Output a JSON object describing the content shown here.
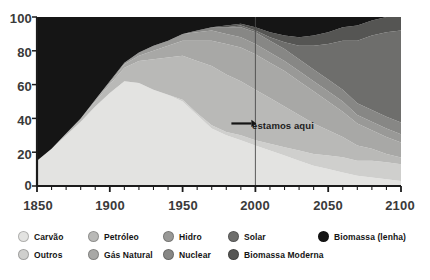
{
  "chart_data": {
    "type": "area",
    "title": "",
    "subtitle": "",
    "xlabel": "",
    "ylabel": "",
    "stacked": true,
    "normalized_percent": true,
    "grid": false,
    "legend_position": "bottom",
    "xlim": [
      1850,
      2100
    ],
    "ylim": [
      0,
      100
    ],
    "xticks": [
      1850,
      1900,
      1950,
      2000,
      2050,
      2100
    ],
    "xtick_labels": [
      "1850",
      "1900",
      "1950",
      "2000",
      "2050",
      "2100"
    ],
    "minor_xtick_step": 10,
    "yticks": [
      0,
      20,
      40,
      60,
      80,
      100
    ],
    "ytick_labels": [
      "0",
      "20",
      "40",
      "60",
      "80",
      "100"
    ],
    "x": [
      1850,
      1860,
      1870,
      1880,
      1890,
      1900,
      1910,
      1920,
      1930,
      1940,
      1950,
      1960,
      1970,
      1980,
      1990,
      2000,
      2010,
      2020,
      2030,
      2040,
      2050,
      2060,
      2070,
      2080,
      2090,
      2100
    ],
    "series": [
      {
        "name": "Carvão",
        "color": "#e3e3e1",
        "values": [
          15,
          22,
          30,
          38,
          47,
          55,
          62,
          61,
          57,
          54,
          50,
          42,
          34,
          30,
          27,
          24,
          21,
          18,
          15,
          12,
          10,
          8,
          6,
          5,
          4,
          3
        ]
      },
      {
        "name": "Petróleo",
        "color": "#b9b9b7",
        "values": [
          0,
          0,
          1,
          2,
          3,
          5,
          8,
          13,
          18,
          22,
          26,
          31,
          35,
          34,
          32,
          30,
          27,
          24,
          21,
          18,
          15,
          12,
          9,
          7,
          5,
          4
        ]
      },
      {
        "name": "Hidro",
        "color": "#999997",
        "values": [
          0,
          0,
          0,
          0,
          0,
          1,
          1,
          2,
          3,
          3,
          4,
          5,
          6,
          6,
          6,
          6,
          6,
          6,
          6,
          6,
          6,
          6,
          5,
          5,
          5,
          5
        ]
      },
      {
        "name": "Solar",
        "color": "#6e6e6c",
        "values": [
          0,
          0,
          0,
          0,
          0,
          0,
          0,
          0,
          0,
          0,
          0,
          0,
          0,
          0,
          1,
          1,
          2,
          4,
          8,
          14,
          21,
          29,
          37,
          44,
          50,
          55
        ]
      },
      {
        "name": "Outros",
        "color": "#cfcfcd",
        "values": [
          0,
          0,
          0,
          0,
          0,
          0,
          0,
          0,
          0,
          0,
          1,
          1,
          2,
          2,
          3,
          3,
          4,
          5,
          6,
          7,
          8,
          9,
          9,
          10,
          10,
          10
        ]
      },
      {
        "name": "Gás Natural",
        "color": "#a8a8a6",
        "values": [
          0,
          0,
          0,
          0,
          1,
          1,
          2,
          3,
          5,
          7,
          9,
          12,
          15,
          18,
          20,
          21,
          21,
          21,
          20,
          19,
          17,
          15,
          13,
          11,
          10,
          9
        ]
      },
      {
        "name": "Nuclear",
        "color": "#878785",
        "values": [
          0,
          0,
          0,
          0,
          0,
          0,
          0,
          0,
          0,
          0,
          0,
          1,
          2,
          4,
          6,
          7,
          7,
          7,
          7,
          7,
          7,
          7,
          7,
          7,
          7,
          7
        ]
      },
      {
        "name": "Biomassa Moderna",
        "color": "#555553",
        "values": [
          0,
          0,
          0,
          0,
          0,
          0,
          0,
          0,
          0,
          0,
          0,
          0,
          0,
          1,
          1,
          2,
          3,
          4,
          5,
          6,
          7,
          8,
          9,
          9,
          9,
          8
        ]
      },
      {
        "name": "Biomassa (lenha)",
        "color": "#151515",
        "values": [
          85,
          78,
          69,
          60,
          49,
          38,
          27,
          21,
          17,
          14,
          10,
          8,
          6,
          5,
          4,
          6,
          9,
          11,
          12,
          11,
          9,
          6,
          5,
          2,
          0,
          0
        ]
      }
    ],
    "stack_order": [
      "Carvão",
      "Outros",
      "Petróleo",
      "Gás Natural",
      "Hidro",
      "Nuclear",
      "Solar",
      "Biomassa Moderna",
      "Biomassa (lenha)"
    ],
    "annotations": [
      {
        "text": "estamos aqui",
        "x": 2000,
        "y": 37,
        "marker": "arrow-right",
        "vertical_line_at_x": 2000
      }
    ]
  },
  "axes": {
    "y_tick_labels": [
      "100",
      "80",
      "60",
      "40",
      "20",
      "0"
    ],
    "x_tick_labels": [
      "1850",
      "1900",
      "1950",
      "2000",
      "2050",
      "2100"
    ]
  },
  "annotation": {
    "label": "estamos aqui"
  },
  "legend": {
    "columns": [
      {
        "entries": [
          {
            "label": "Carvão",
            "color": "#e3e3e1"
          },
          {
            "label": "Outros",
            "color": "#cfcfcd"
          }
        ]
      },
      {
        "entries": [
          {
            "label": "Petróleo",
            "color": "#b9b9b7"
          },
          {
            "label": "Gás Natural",
            "color": "#a8a8a6"
          }
        ]
      },
      {
        "entries": [
          {
            "label": "Hidro",
            "color": "#999997"
          },
          {
            "label": "Nuclear",
            "color": "#878785"
          }
        ]
      },
      {
        "entries": [
          {
            "label": "Solar",
            "color": "#6e6e6c"
          },
          {
            "label": "Biomassa Moderna",
            "color": "#555553"
          }
        ]
      },
      {
        "entries": [
          {
            "label": "Biomassa (lenha)",
            "color": "#151515"
          }
        ]
      }
    ]
  }
}
